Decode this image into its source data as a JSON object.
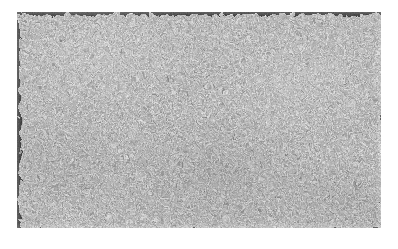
{
  "page": {
    "width": 398,
    "height": 249,
    "background_color": "#ffffff",
    "content_type": "grayscale-micrograph",
    "has_text": false,
    "has_scale_bar": false,
    "has_axes": false,
    "has_border": false
  },
  "micrograph": {
    "name": "fibrous-texture-micrograph",
    "x": 17,
    "y": 12,
    "width": 364,
    "height": 216,
    "description": "Dense randomly oriented fine fibrous whisker-like grains filling the frame",
    "base_gray": "#a9a9a9",
    "dark_gray": "#5a5a5a",
    "light_gray": "#e2e2e2",
    "mean_gray": "#a8a8a8",
    "grain_scale": "fine",
    "orientation": "isotropic-random"
  },
  "texture_params": {
    "fine_grain_frequency": 0.62,
    "fine_grain_octaves": 3,
    "fiber_frequency": 0.085,
    "fiber_octaves": 2,
    "displacement_scale": 11,
    "contrast": 0.9
  }
}
